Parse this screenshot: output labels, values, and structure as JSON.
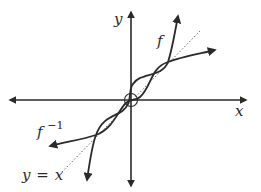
{
  "diagram": {
    "axes": {
      "x_label": "x",
      "y_label": "y"
    },
    "curves": [
      {
        "name": "f",
        "label": "f",
        "style": "solid"
      },
      {
        "name": "f-inverse",
        "label": "f",
        "label_superscript": "−1",
        "style": "solid"
      }
    ],
    "reference_line": {
      "label": "y = x",
      "label_y": "y",
      "label_eq": "=",
      "label_x": "x",
      "style": "dotted"
    },
    "origin_marker": "circle",
    "colors": {
      "stroke": "#2a2a2a",
      "dotted": "#6a6a6a",
      "background": "#ffffff"
    }
  }
}
